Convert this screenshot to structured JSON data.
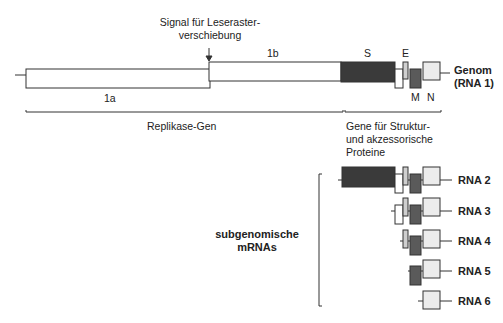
{
  "diagram": {
    "frameshift_signal": {
      "line1": "Signal für Leseraster-",
      "line2": "verschiebung"
    },
    "orf_labels": {
      "orf1a": "1a",
      "orf1b": "1b"
    },
    "gene_labels": {
      "S": "S",
      "E": "E",
      "M": "M",
      "N": "N"
    },
    "genome_label": {
      "line1": "Genom",
      "line2": "(RNA 1)"
    },
    "replicase_label": "Replikase-Gen",
    "structural_label": {
      "line1": "Gene für Struktur-",
      "line2": "und akzessorische",
      "line3": "Proteine"
    },
    "subgenomic_label": {
      "line1": "subgenomische",
      "line2": "mRNAs"
    },
    "rna_labels": [
      "RNA 2",
      "RNA 3",
      "RNA 4",
      "RNA 5",
      "RNA 6"
    ],
    "colors": {
      "S": "#3a3a3a",
      "M": "#5a5a5a",
      "E": "#cfcfcf",
      "N": "#ececec",
      "accessory": "#ffffff",
      "stroke": "#333333"
    }
  }
}
